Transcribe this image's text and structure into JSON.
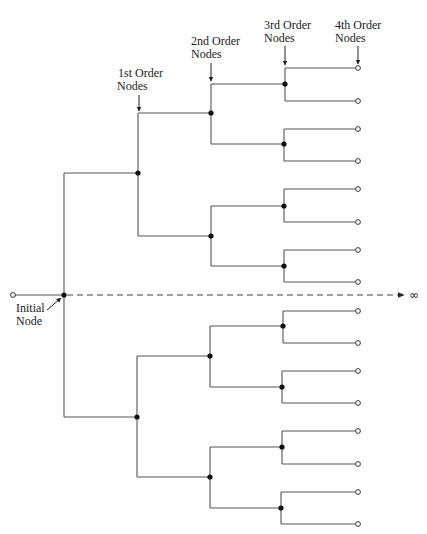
{
  "diagram": {
    "type": "binary-tree",
    "labels": {
      "first_order": [
        "1st Order",
        "Nodes"
      ],
      "second_order": [
        "2nd Order",
        "Nodes"
      ],
      "third_order": [
        "3rd Order",
        "Nodes"
      ],
      "fourth_order": [
        "4th Order",
        "Nodes"
      ],
      "initial": [
        "Initial",
        "Node"
      ],
      "infinity": "∞"
    },
    "colors": {
      "line": "#555555",
      "node": "#111111",
      "text": "#222222"
    },
    "initial_node": {
      "x": 64,
      "y": 295
    },
    "root_terminal": {
      "x": 13,
      "y": 295
    },
    "dashed_axis": {
      "x1": 64,
      "x2": 400,
      "y": 295
    },
    "first_order_nodes": [
      {
        "x": 138,
        "y": 173
      },
      {
        "x": 137,
        "y": 417
      }
    ],
    "second_order_nodes": [
      {
        "x": 211,
        "y": 113
      },
      {
        "x": 211,
        "y": 236
      },
      {
        "x": 210,
        "y": 356
      },
      {
        "x": 210,
        "y": 477
      }
    ],
    "third_order_nodes": [
      {
        "x": 285,
        "y": 84
      },
      {
        "x": 284,
        "y": 144
      },
      {
        "x": 284,
        "y": 206
      },
      {
        "x": 284,
        "y": 266
      },
      {
        "x": 283,
        "y": 326
      },
      {
        "x": 282,
        "y": 387
      },
      {
        "x": 282,
        "y": 447
      },
      {
        "x": 281,
        "y": 508
      }
    ],
    "fourth_order_nodes_y": [
      68,
      101,
      129,
      161,
      189,
      222,
      250,
      282,
      311,
      343,
      371,
      403,
      431,
      464,
      492,
      524
    ],
    "fourth_order_x": 358
  }
}
